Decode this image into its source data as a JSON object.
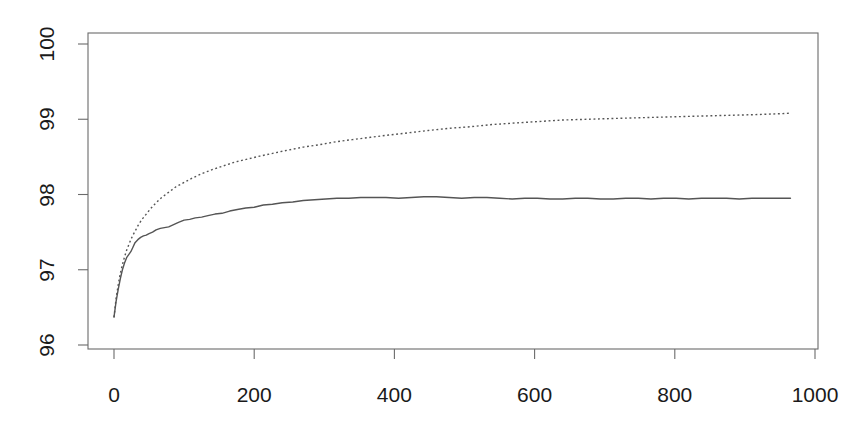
{
  "figure": {
    "background_color": "#ffffff",
    "axis_color": "#6b6b6b",
    "line_color": "#555555",
    "text_color": "#1a1a1a"
  },
  "chart_data": {
    "type": "line",
    "title": "",
    "subtitle": "",
    "xlabel": "",
    "ylabel": "",
    "xlim": [
      0,
      1000
    ],
    "ylim": [
      96,
      100
    ],
    "grid": false,
    "legend": null,
    "xticks": [
      0,
      200,
      400,
      600,
      800,
      1000
    ],
    "xtick_labels": [
      "0",
      "200",
      "400",
      "600",
      "800",
      "1000"
    ],
    "yticks": [
      96,
      97,
      98,
      99,
      100
    ],
    "ytick_labels": [
      "96",
      "97",
      "98",
      "99",
      "100"
    ],
    "ytick_label_rotation": 90,
    "series": [
      {
        "name": "solid-curve",
        "style": "solid",
        "color": "#555555",
        "width": 1.4,
        "x": [
          0,
          3,
          6,
          9,
          12,
          15,
          18,
          21,
          24,
          27,
          30,
          34,
          38,
          42,
          46,
          50,
          55,
          60,
          66,
          72,
          78,
          85,
          92,
          100,
          108,
          116,
          125,
          134,
          144,
          154,
          165,
          176,
          188,
          200,
          213,
          226,
          240,
          255,
          270,
          286,
          302,
          318,
          335,
          352,
          370,
          388,
          406,
          424,
          442,
          460,
          478,
          496,
          514,
          532,
          550,
          568,
          586,
          604,
          622,
          640,
          658,
          676,
          694,
          712,
          730,
          748,
          766,
          784,
          802,
          820,
          838,
          856,
          874,
          892,
          910,
          928,
          946,
          965
        ],
        "y": [
          96.37,
          96.58,
          96.74,
          96.88,
          97.0,
          97.09,
          97.16,
          97.2,
          97.24,
          97.3,
          97.36,
          97.4,
          97.43,
          97.45,
          97.46,
          97.48,
          97.5,
          97.53,
          97.55,
          97.56,
          97.57,
          97.6,
          97.63,
          97.66,
          97.67,
          97.69,
          97.7,
          97.72,
          97.74,
          97.75,
          97.78,
          97.8,
          97.82,
          97.83,
          97.86,
          97.87,
          97.89,
          97.9,
          97.92,
          97.93,
          97.94,
          97.95,
          97.95,
          97.96,
          97.96,
          97.96,
          97.95,
          97.96,
          97.97,
          97.97,
          97.96,
          97.95,
          97.96,
          97.96,
          97.95,
          97.94,
          97.95,
          97.95,
          97.94,
          97.94,
          97.95,
          97.95,
          97.94,
          97.94,
          97.95,
          97.95,
          97.94,
          97.95,
          97.95,
          97.94,
          97.95,
          97.95,
          97.95,
          97.94,
          97.95,
          97.95,
          97.95,
          97.95
        ]
      },
      {
        "name": "dotted-curve",
        "style": "dotted",
        "color": "#555555",
        "width": 1.4,
        "x": [
          0,
          3,
          6,
          9,
          12,
          15,
          18,
          21,
          24,
          27,
          30,
          35,
          40,
          46,
          52,
          60,
          68,
          78,
          88,
          100,
          112,
          126,
          140,
          156,
          172,
          190,
          208,
          228,
          248,
          270,
          292,
          316,
          340,
          366,
          392,
          420,
          448,
          478,
          508,
          540,
          572,
          606,
          640,
          676,
          712,
          750,
          788,
          828,
          868,
          910,
          940,
          965
        ],
        "y": [
          96.37,
          96.62,
          96.8,
          96.95,
          97.07,
          97.17,
          97.26,
          97.33,
          97.4,
          97.46,
          97.51,
          97.6,
          97.67,
          97.74,
          97.81,
          97.89,
          97.96,
          98.03,
          98.1,
          98.16,
          98.22,
          98.28,
          98.33,
          98.38,
          98.43,
          98.47,
          98.51,
          98.55,
          98.59,
          98.63,
          98.66,
          98.7,
          98.73,
          98.76,
          98.79,
          98.82,
          98.85,
          98.88,
          98.9,
          98.93,
          98.95,
          98.97,
          98.99,
          99.0,
          99.01,
          99.02,
          99.03,
          99.04,
          99.05,
          99.06,
          99.07,
          99.08
        ]
      }
    ]
  }
}
